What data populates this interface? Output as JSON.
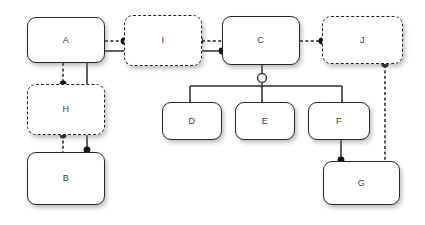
{
  "diagram": {
    "background_color": "#ffffff",
    "line_color": "#262626",
    "label_color": "#3a3a3a",
    "width": 425,
    "height": 225,
    "nodes": [
      {
        "id": "A",
        "label": "A",
        "border": "solid",
        "x": 27,
        "y": 17,
        "w": 78,
        "h": 46
      },
      {
        "id": "I",
        "label": "I",
        "border": "dashed",
        "x": 124,
        "y": 15,
        "w": 78,
        "h": 51
      },
      {
        "id": "C",
        "label": "C",
        "border": "solid",
        "x": 222,
        "y": 16,
        "w": 78,
        "h": 49
      },
      {
        "id": "J",
        "label": "J",
        "border": "dashed",
        "x": 322,
        "y": 16,
        "w": 81,
        "h": 48
      },
      {
        "id": "H",
        "label": "H",
        "border": "dashed",
        "x": 27,
        "y": 84,
        "w": 78,
        "h": 51
      },
      {
        "id": "B",
        "label": "B",
        "border": "solid",
        "x": 27,
        "y": 152,
        "w": 78,
        "h": 53
      },
      {
        "id": "D",
        "label": "D",
        "border": "solid",
        "x": 162,
        "y": 102,
        "w": 60,
        "h": 38
      },
      {
        "id": "E",
        "label": "E",
        "border": "solid",
        "x": 235,
        "y": 102,
        "w": 60,
        "h": 38
      },
      {
        "id": "F",
        "label": "F",
        "border": "solid",
        "x": 308,
        "y": 102,
        "w": 62,
        "h": 38
      },
      {
        "id": "G",
        "label": "G",
        "border": "solid",
        "x": 323,
        "y": 161,
        "w": 77,
        "h": 44
      }
    ],
    "edges": [
      {
        "id": "A-I",
        "from": "A",
        "to": "I",
        "style": "dashed",
        "endpoint": "dot"
      },
      {
        "id": "I-C",
        "from": "I",
        "to": "C",
        "style": "dashed",
        "endpoint": "dot"
      },
      {
        "id": "A-C",
        "from": "A",
        "to": "C",
        "style": "solid",
        "endpoint": "dot"
      },
      {
        "id": "C-J",
        "from": "C",
        "to": "J",
        "style": "dashed",
        "endpoint": "dot"
      },
      {
        "id": "A-H",
        "from": "A",
        "to": "H",
        "style": "dashed",
        "endpoint": "dot"
      },
      {
        "id": "H-B",
        "from": "H",
        "to": "B",
        "style": "dashed",
        "endpoint": "none"
      },
      {
        "id": "A-B",
        "from": "A",
        "to": "B",
        "style": "solid",
        "endpoint": "dot"
      },
      {
        "id": "C-bus",
        "from": "C",
        "to": "bus",
        "style": "solid",
        "endpoint": "circle"
      },
      {
        "id": "bus-D",
        "from": "bus",
        "to": "D",
        "style": "solid",
        "endpoint": "none"
      },
      {
        "id": "bus-E",
        "from": "bus",
        "to": "E",
        "style": "solid",
        "endpoint": "none"
      },
      {
        "id": "bus-F",
        "from": "bus",
        "to": "F",
        "style": "solid",
        "endpoint": "none"
      },
      {
        "id": "F-G",
        "from": "F",
        "to": "G",
        "style": "solid",
        "endpoint": "dot"
      },
      {
        "id": "J-G",
        "from": "J",
        "to": "G",
        "style": "dashed",
        "endpoint": "dot"
      }
    ],
    "junction": {
      "id": "bus-junction",
      "cx": 262,
      "cy": 78,
      "r": 4.5
    }
  }
}
